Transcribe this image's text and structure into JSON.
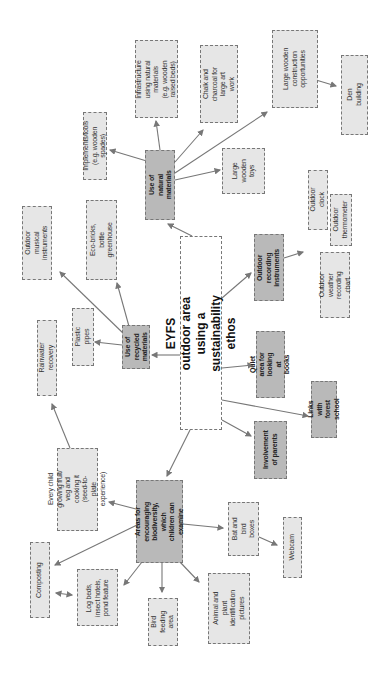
{
  "diagram": {
    "title": "EYFS outdoor area using a sustainability ethos",
    "orientation": "rotated 90° counter-clockwise",
    "central": {
      "id": "central",
      "label": "EYFS outdoor area using a sustainability ethos"
    },
    "hubs": [
      {
        "id": "natural",
        "label": "Use of natural materials"
      },
      {
        "id": "recycled",
        "label": "Use of recycled materials"
      },
      {
        "id": "biodiversity",
        "label": "Areas for encouraging biodiversity, which children can examine"
      },
      {
        "id": "parents",
        "label": "Involvement of parents"
      },
      {
        "id": "forest",
        "label": "Links with forest school"
      },
      {
        "id": "quiet",
        "label": "Quiet area for looking at books"
      },
      {
        "id": "recording",
        "label": "Outdoor recording instruments"
      }
    ],
    "leaves": [
      {
        "id": "implements",
        "label": "Implements/tools (e.g. wooden spades)",
        "parent": "natural"
      },
      {
        "id": "infrastructure",
        "label": "Infrastructure using natural materials (e.g. wooden raised beds)",
        "parent": "natural"
      },
      {
        "id": "chalk",
        "label": "Chalk and charcoal for large art work",
        "parent": "natural"
      },
      {
        "id": "toys",
        "label": "Large wooden toys",
        "parent": "natural"
      },
      {
        "id": "construction",
        "label": "Large wooden construction opportunities",
        "parent": "natural"
      },
      {
        "id": "den",
        "label": "Den building",
        "parent": "construction"
      },
      {
        "id": "ecobricks",
        "label": "Eco-bricks, bottle greenhouse",
        "parent": "recycled"
      },
      {
        "id": "musical",
        "label": "Outdoor musical instruments",
        "parent": "recycled"
      },
      {
        "id": "pipes",
        "label": "Plastic pipes",
        "parent": "recycled"
      },
      {
        "id": "rainwater",
        "label": "Rainwater recovery",
        "parent": "every-child"
      },
      {
        "id": "every-child",
        "label": "Every child growing fruit/ veg and cooking it (seed-to-plate experience)",
        "parent": "biodiversity"
      },
      {
        "id": "composting",
        "label": "Composting",
        "parent": "biodiversity"
      },
      {
        "id": "logbeds",
        "label": "Log beds, insect hotels, pond feature",
        "parent": "biodiversity"
      },
      {
        "id": "birdfeeding",
        "label": "Bird feeding area",
        "parent": "biodiversity"
      },
      {
        "id": "animalplant",
        "label": "Animal and plant identification pictures",
        "parent": "biodiversity"
      },
      {
        "id": "batboxes",
        "label": "Bat and bird boxes",
        "parent": "biodiversity"
      },
      {
        "id": "webcam",
        "label": "Webcam",
        "parent": "batboxes"
      },
      {
        "id": "clock",
        "label": "Outdoor clock",
        "parent": "recording"
      },
      {
        "id": "thermometer",
        "label": "Outdoor thermometer",
        "parent": "recording"
      },
      {
        "id": "weatherchart",
        "label": "Outdoor weather recording chart",
        "parent": "recording"
      }
    ],
    "bidirectional": [
      [
        "composting",
        "logbeds"
      ]
    ],
    "colors": {
      "hub_fill": "#b9b9b9",
      "leaf_fill": "#e6e6e6",
      "central_fill": "#ffffff",
      "border": "#777777",
      "arrow": "#777777"
    }
  }
}
